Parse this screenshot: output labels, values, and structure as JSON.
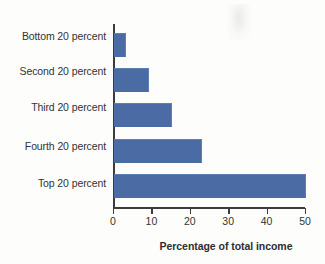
{
  "chart_data": {
    "type": "bar",
    "orientation": "horizontal",
    "title": "",
    "xlabel": "Percentage of total income",
    "ylabel": "",
    "xlim": [
      0,
      50
    ],
    "xticks": [
      0,
      10,
      20,
      30,
      40,
      50
    ],
    "xtick_labels": [
      "0",
      "10",
      "20",
      "30",
      "40",
      "50"
    ],
    "grid": false,
    "legend": false,
    "bar_color": "#4a6ba3",
    "axis_color": "#3c3c3c",
    "text_color": "#333335",
    "background_color": "#fdfdfb",
    "categories": [
      "Bottom 20 percent",
      "Second 20 percent",
      "Third 20 percent",
      "Fourth 20 percent",
      "Top 20 percent"
    ],
    "values": [
      3,
      9,
      15,
      23,
      50
    ]
  }
}
